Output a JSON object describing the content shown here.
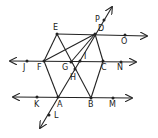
{
  "diagram": {
    "type": "geometry-lines-and-points",
    "points": [
      {
        "id": "E",
        "label": "E",
        "x": 57,
        "y": 34,
        "lx": 53,
        "ly": 30
      },
      {
        "id": "D",
        "label": "D",
        "x": 95,
        "y": 34,
        "lx": 98,
        "ly": 31
      },
      {
        "id": "P",
        "label": "P",
        "x": 104,
        "y": 20,
        "lx": 95,
        "ly": 22
      },
      {
        "id": "O",
        "label": "O",
        "x": 125,
        "y": 35,
        "lx": 121,
        "ly": 44
      },
      {
        "id": "J",
        "label": "J",
        "x": 27,
        "y": 61,
        "lx": 23,
        "ly": 70
      },
      {
        "id": "F",
        "label": "F",
        "x": 44,
        "y": 61,
        "lx": 37,
        "ly": 70
      },
      {
        "id": "G",
        "label": "G",
        "x": 71,
        "y": 62,
        "lx": 62,
        "ly": 70
      },
      {
        "id": "I",
        "label": "I",
        "x": 80,
        "y": 61,
        "lx": 84,
        "ly": 59
      },
      {
        "id": "C",
        "label": "C",
        "x": 103,
        "y": 61,
        "lx": 101,
        "ly": 70
      },
      {
        "id": "N",
        "label": "N",
        "x": 121,
        "y": 62,
        "lx": 117,
        "ly": 70
      },
      {
        "id": "H",
        "label": "H",
        "x": 75,
        "y": 69,
        "lx": 70,
        "ly": 80
      },
      {
        "id": "K",
        "label": "K",
        "x": 37,
        "y": 97,
        "lx": 34,
        "ly": 107
      },
      {
        "id": "A",
        "label": "A",
        "x": 58,
        "y": 97,
        "lx": 57,
        "ly": 107
      },
      {
        "id": "B",
        "label": "B",
        "x": 91,
        "y": 98,
        "lx": 88,
        "ly": 107
      },
      {
        "id": "M",
        "label": "M",
        "x": 113,
        "y": 98,
        "lx": 109,
        "ly": 107
      },
      {
        "id": "L",
        "label": "L",
        "x": 49,
        "y": 115,
        "lx": 54,
        "ly": 118
      }
    ],
    "lines": [
      {
        "name": "line-EO",
        "x1": 57,
        "y1": 34,
        "x2": 147,
        "y2": 36,
        "arrow_end": true
      },
      {
        "name": "line-JN",
        "x1": 10,
        "y1": 61,
        "x2": 136,
        "y2": 62,
        "arrow_start": true,
        "arrow_end": true
      },
      {
        "name": "line-KM",
        "x1": 13,
        "y1": 97,
        "x2": 132,
        "y2": 98,
        "arrow_start": true,
        "arrow_end": true
      },
      {
        "name": "line-LP",
        "x1": 40,
        "y1": 128,
        "x2": 112,
        "y2": 7,
        "arrow_start": true,
        "arrow_end": true
      }
    ],
    "segments": [
      {
        "name": "segment-EF",
        "from": "E",
        "to": "F"
      },
      {
        "name": "segment-FA",
        "from": "F",
        "to": "A"
      },
      {
        "name": "segment-EB",
        "from": "E",
        "to": "B"
      },
      {
        "name": "segment-DC",
        "from": "D",
        "to": "C"
      },
      {
        "name": "segment-CB",
        "from": "C",
        "to": "B"
      },
      {
        "name": "segment-FD",
        "from": "F",
        "to": "D"
      },
      {
        "name": "segment-DG",
        "from": "D",
        "to": "G"
      }
    ]
  }
}
